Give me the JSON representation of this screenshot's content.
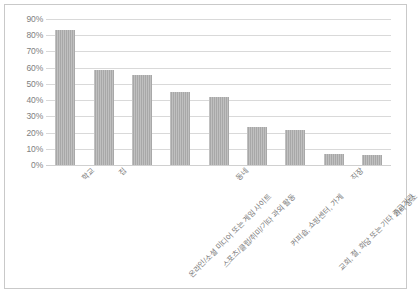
{
  "chart_data": {
    "type": "bar",
    "title": "",
    "subtitle": "",
    "xlabel": "",
    "ylabel": "",
    "ylim": [
      0,
      90
    ],
    "grid": true,
    "legend": false,
    "legend_position": "none",
    "orientation": "vertical",
    "bar_color": "#a8a8a8",
    "gridline_color": "#d9d9d9",
    "border_color": "#c9c9c9",
    "tick_label_color": "#808080",
    "y_ticks": [
      "0%",
      "10%",
      "20%",
      "30%",
      "40%",
      "50%",
      "60%",
      "70%",
      "80%",
      "90%"
    ],
    "y_tick_values": [
      0,
      10,
      20,
      30,
      40,
      50,
      60,
      70,
      80,
      90
    ],
    "categories": [
      "학교",
      "집",
      "온라인/소셜 미디어 또는 게임 사이트",
      "스포츠/클럽/취미/기타 과외 활동",
      "동네",
      "커피숍, 쇼핑센터, 가게",
      "교회, 절, 회당 또는 기타 종교기관",
      "직장",
      "기타 장소"
    ],
    "values": [
      83.5,
      58.5,
      55.5,
      45.0,
      42.0,
      23.5,
      21.5,
      7.0,
      6.0
    ],
    "value_labels": [
      "83.5%",
      "58.5%",
      "55.5%",
      "45%",
      "42%",
      "23.5%",
      "21.5%",
      "7%",
      "6%"
    ],
    "label_tiers": [
      1,
      1,
      2,
      2,
      1,
      2,
      2,
      1,
      2
    ]
  }
}
